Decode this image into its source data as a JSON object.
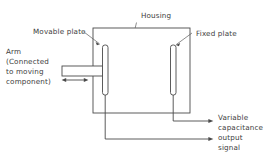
{
  "figure": {
    "name": "variable-capacitance-displacement-transducer",
    "background_color": "#ffffff",
    "line_color": "#4a4a4a",
    "text_color": "#3d3d3d"
  },
  "labels": {
    "housing": "Housing",
    "movable_plate": "Movable plate",
    "fixed_plate": "Fixed plate",
    "arm_line1": "Arm",
    "arm_line2": "(Connected",
    "arm_line3": "to moving",
    "arm_line4": "component)",
    "output_line1": "Variable",
    "output_line2": "capacitance",
    "output_line3": "output",
    "output_line4": "signal"
  },
  "components": {
    "housing_box": {
      "x": 93,
      "y": 28,
      "width": 97,
      "height": 85
    },
    "movable_plate": {
      "x": 102.5,
      "y": 45,
      "width": 5.5,
      "height": 50,
      "radius": 2.4
    },
    "fixed_plate": {
      "x": 170.5,
      "y": 45,
      "width": 5.5,
      "height": 50,
      "radius": 2.4
    },
    "arm_bar": {
      "x": 62,
      "y": 66,
      "width": 41,
      "height": 10
    },
    "travel_arrow": {
      "x1": 62,
      "x2": 88,
      "y": 80
    }
  },
  "wiring": {
    "movable_wire_drop_y": 139,
    "fixed_wire_drop_y": 121,
    "output_arrow_x": 213,
    "movable_wire_x": 105.2,
    "fixed_wire_x": 173.2
  },
  "leaders": {
    "housing_tick": "M 136.5 22.5 L 135.2 28",
    "movable_plate_leader": "M 84 32 L 100 44",
    "fixed_plate_leader": "M 192 33 L 175.5 45"
  }
}
